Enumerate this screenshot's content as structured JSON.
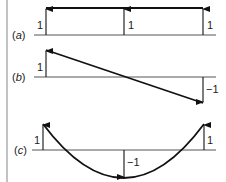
{
  "diagram": {
    "border_color": "#999999",
    "line_color": "#111111",
    "baseline_color": "#555555",
    "parts": [
      {
        "id": "a",
        "label_open": "(",
        "label_letter": "a",
        "label_close": ")",
        "description": "uniform distribution",
        "arrow_labels": [
          "1",
          "1",
          "1"
        ]
      },
      {
        "id": "b",
        "label_open": "(",
        "label_letter": "b",
        "label_close": ")",
        "description": "linear distribution",
        "arrow_labels": [
          "1",
          "−1"
        ]
      },
      {
        "id": "c",
        "label_open": "(",
        "label_letter": "c",
        "label_close": ")",
        "description": "parabolic distribution",
        "arrow_labels": [
          "1",
          "−1",
          "1"
        ]
      }
    ]
  }
}
